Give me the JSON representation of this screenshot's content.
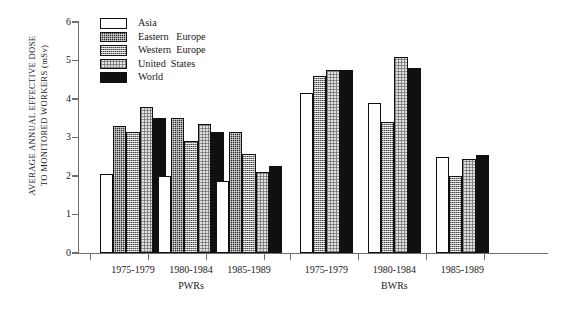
{
  "chart_data": {
    "type": "bar",
    "title": "",
    "xlabel": "",
    "ylabel_lines": [
      "AVERAGE ANNUAL  EFFECTIVE  DOSE",
      "TO MONITORED WORKERS  (mSv)"
    ],
    "ylabel": "AVERAGE ANNUAL EFFECTIVE DOSE TO MONITORED WORKERS (mSv)",
    "ylim": [
      0,
      6
    ],
    "yticks": [
      0,
      1,
      2,
      3,
      4,
      5,
      6
    ],
    "ytick_labels": [
      "0",
      "1",
      "2",
      "3",
      "4",
      "5",
      "6"
    ],
    "grid": false,
    "legend_position": "top-left-inside",
    "series": [
      {
        "name": "Asia",
        "swatch": "white",
        "values": [
          2.05,
          2.0,
          1.88,
          4.15,
          3.9,
          2.5
        ]
      },
      {
        "name": "Eastern  Europe",
        "swatch": "dark-stipple",
        "values": [
          3.3,
          3.5,
          3.15,
          null,
          null,
          null
        ]
      },
      {
        "name": "Western  Europe",
        "swatch": "mid-stipple",
        "values": [
          3.15,
          2.9,
          2.58,
          4.6,
          3.4,
          2.0
        ]
      },
      {
        "name": "United  States",
        "swatch": "light-stipple",
        "values": [
          3.8,
          3.35,
          2.1,
          4.75,
          5.08,
          2.45
        ]
      },
      {
        "name": "World",
        "swatch": "black",
        "values": [
          3.5,
          3.15,
          2.25,
          4.75,
          4.8,
          2.55
        ]
      }
    ],
    "categories": [
      "1975-1979",
      "1980-1984",
      "1985-1989",
      "1975-1979",
      "1980-1984",
      "1985-1989"
    ],
    "groups": [
      {
        "label": "PWRs",
        "categories": [
          "1975-1979",
          "1980-1984",
          "1985-1989"
        ]
      },
      {
        "label": "BWRs",
        "categories": [
          "1975-1979",
          "1980-1984",
          "1985-1989"
        ]
      }
    ]
  },
  "legend": {
    "items": [
      {
        "label": "Asia"
      },
      {
        "label": "Eastern   Europe"
      },
      {
        "label": "Western  Europe"
      },
      {
        "label": "United  States"
      },
      {
        "label": "World"
      }
    ]
  },
  "axis": {
    "y_title_line1": "AVERAGE ANNUAL  EFFECTIVE  DOSE",
    "y_title_line2": "TO MONITORED WORKERS  (mSv)",
    "ticks": [
      "6",
      "5",
      "4",
      "3",
      "2",
      "1",
      "0"
    ]
  },
  "xaxis": {
    "cat_labels": [
      "1975-1979",
      "1980-1984",
      "1985-1989",
      "1975-1979",
      "1980-1984",
      "1985-1989"
    ],
    "group_labels": [
      "PWRs",
      "BWRs"
    ]
  },
  "colors": {
    "axis": "#6f6f6f",
    "bar_outline": "#111111",
    "asia": "#ffffff",
    "eastern_europe": "#2a2a2a",
    "western_europe": "#9a9a9a",
    "united_states": "#e2e2e2",
    "world": "#101010",
    "text": "#1a1a1a"
  }
}
